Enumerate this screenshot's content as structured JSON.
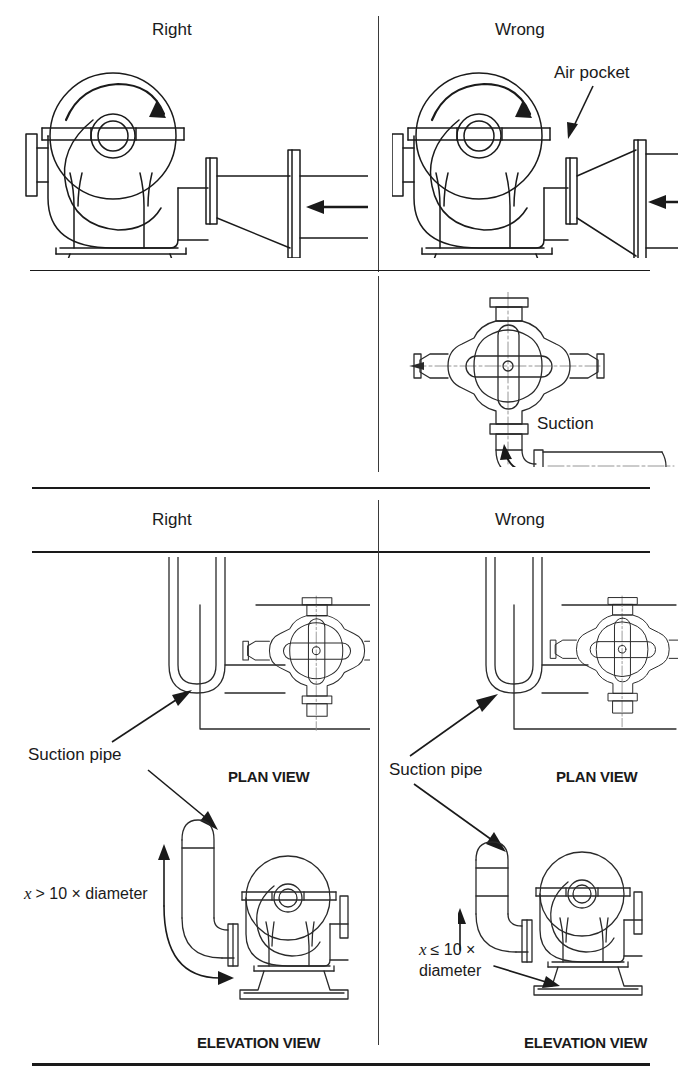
{
  "document": {
    "title": "Pump suction piping: right and wrong arrangements",
    "type": "technical-line-diagram"
  },
  "sections": {
    "top": {
      "left_header": "Right",
      "right_header": "Wrong",
      "annotations": {
        "air_pocket": "Air pocket",
        "suction": "Suction"
      }
    },
    "bottom": {
      "left_header": "Right",
      "right_header": "Wrong",
      "left": {
        "suction_pipe_label": "Suction pipe",
        "plan_view_label": "PLAN VIEW",
        "elevation_view_label": "ELEVATION VIEW",
        "distance_note_prefix": "x",
        "distance_note_body": "> 10 × diameter"
      },
      "right": {
        "suction_pipe_label": "Suction pipe",
        "plan_view_label": "PLAN VIEW",
        "elevation_view_label": "ELEVATION VIEW",
        "distance_note_prefix": "x",
        "distance_note_body_line1": "≤ 10 ×",
        "distance_note_body_line2": "diameter"
      }
    }
  },
  "colors": {
    "ink": "#1a1a1a",
    "line": "#2a2a2a",
    "centerline": "#7a7a7a",
    "background": "#ffffff"
  }
}
